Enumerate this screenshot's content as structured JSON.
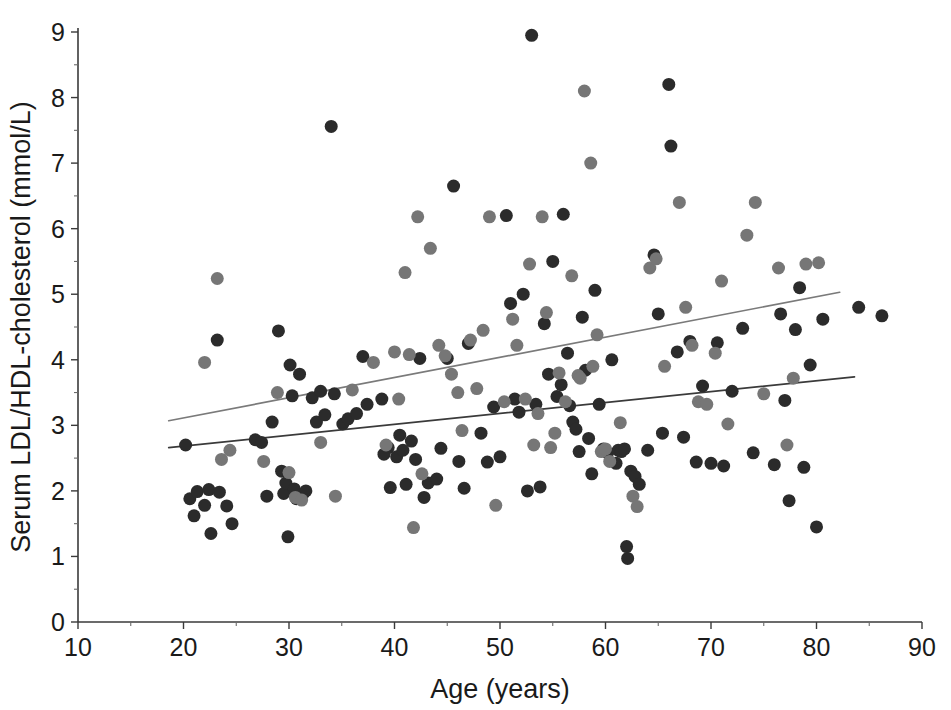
{
  "chart_data": {
    "type": "scatter",
    "title": "",
    "xlabel": "Age (years)",
    "ylabel": "Serum LDL/HDL-cholesterol  (mmol/L)",
    "xlim": [
      10,
      90
    ],
    "ylim": [
      0,
      9
    ],
    "xticks": [
      10,
      20,
      30,
      40,
      50,
      60,
      70,
      80,
      90
    ],
    "yticks": [
      0,
      1,
      2,
      3,
      4,
      5,
      6,
      7,
      8,
      9
    ],
    "x_minor_ticks": [
      15,
      25,
      35,
      45,
      55,
      65,
      75,
      85
    ],
    "y_minor_ticks": [
      0.5,
      1.5,
      2.5,
      3.5,
      4.5,
      5.5,
      6.5,
      7.5,
      8.5
    ],
    "grid": false,
    "legend": "none",
    "marker_radius_px": 6.5,
    "colors": {
      "series_dark": "#2b2b2b",
      "series_gray": "#767676",
      "trend_dark": "#3a3a3a",
      "trend_gray": "#7a7a7a",
      "axis": "#3a3a3a",
      "background": "#ffffff"
    },
    "series": [
      {
        "name": "Group A (dark markers)",
        "color": "#2b2b2b",
        "points": [
          [
            20.2,
            2.7
          ],
          [
            20.6,
            1.88
          ],
          [
            21.0,
            1.62
          ],
          [
            21.3,
            1.99
          ],
          [
            22.0,
            1.78
          ],
          [
            22.4,
            2.02
          ],
          [
            22.6,
            1.35
          ],
          [
            23.2,
            4.3
          ],
          [
            23.4,
            1.98
          ],
          [
            24.1,
            1.77
          ],
          [
            24.6,
            1.5
          ],
          [
            26.8,
            2.78
          ],
          [
            27.4,
            2.74
          ],
          [
            27.9,
            1.92
          ],
          [
            28.4,
            3.05
          ],
          [
            29.0,
            4.44
          ],
          [
            29.3,
            2.3
          ],
          [
            29.5,
            1.96
          ],
          [
            29.7,
            2.12
          ],
          [
            29.9,
            1.3
          ],
          [
            30.1,
            3.92
          ],
          [
            30.3,
            3.45
          ],
          [
            30.5,
            2.03
          ],
          [
            30.7,
            1.88
          ],
          [
            31.0,
            3.78
          ],
          [
            31.3,
            1.95
          ],
          [
            31.6,
            2.0
          ],
          [
            32.2,
            3.42
          ],
          [
            32.6,
            3.05
          ],
          [
            33.0,
            3.52
          ],
          [
            33.4,
            3.16
          ],
          [
            34.0,
            7.56
          ],
          [
            34.3,
            3.48
          ],
          [
            35.1,
            3.02
          ],
          [
            35.6,
            3.1
          ],
          [
            36.4,
            3.18
          ],
          [
            37.0,
            4.05
          ],
          [
            37.4,
            3.32
          ],
          [
            38.8,
            3.4
          ],
          [
            39.0,
            2.56
          ],
          [
            39.4,
            2.66
          ],
          [
            39.6,
            2.05
          ],
          [
            40.2,
            2.52
          ],
          [
            40.5,
            2.85
          ],
          [
            40.8,
            2.62
          ],
          [
            41.1,
            2.1
          ],
          [
            41.6,
            2.76
          ],
          [
            42.0,
            2.48
          ],
          [
            42.4,
            4.02
          ],
          [
            42.8,
            1.9
          ],
          [
            43.2,
            2.12
          ],
          [
            44.0,
            2.18
          ],
          [
            44.4,
            2.65
          ],
          [
            45.0,
            4.02
          ],
          [
            45.6,
            6.65
          ],
          [
            46.1,
            2.45
          ],
          [
            46.6,
            2.04
          ],
          [
            47.0,
            4.25
          ],
          [
            48.2,
            2.88
          ],
          [
            48.8,
            2.44
          ],
          [
            49.4,
            3.28
          ],
          [
            50.0,
            2.52
          ],
          [
            50.6,
            6.2
          ],
          [
            51.0,
            4.86
          ],
          [
            51.4,
            3.4
          ],
          [
            51.8,
            3.2
          ],
          [
            52.2,
            5.0
          ],
          [
            52.6,
            2.0
          ],
          [
            53.0,
            8.95
          ],
          [
            53.4,
            3.32
          ],
          [
            53.8,
            2.06
          ],
          [
            54.2,
            4.55
          ],
          [
            54.6,
            3.78
          ],
          [
            55.0,
            5.5
          ],
          [
            55.4,
            3.44
          ],
          [
            55.8,
            3.62
          ],
          [
            56.0,
            6.22
          ],
          [
            56.4,
            4.1
          ],
          [
            56.6,
            3.3
          ],
          [
            56.9,
            3.05
          ],
          [
            57.2,
            2.94
          ],
          [
            57.5,
            2.6
          ],
          [
            57.8,
            4.65
          ],
          [
            58.1,
            3.84
          ],
          [
            58.4,
            2.8
          ],
          [
            58.7,
            2.26
          ],
          [
            59.0,
            5.06
          ],
          [
            59.4,
            3.32
          ],
          [
            59.8,
            2.64
          ],
          [
            60.2,
            2.58
          ],
          [
            60.6,
            4.0
          ],
          [
            61.0,
            2.42
          ],
          [
            61.2,
            2.62
          ],
          [
            61.5,
            2.6
          ],
          [
            61.8,
            2.64
          ],
          [
            62.0,
            1.15
          ],
          [
            62.1,
            0.97
          ],
          [
            62.4,
            2.3
          ],
          [
            62.8,
            2.22
          ],
          [
            63.2,
            2.1
          ],
          [
            64.0,
            2.62
          ],
          [
            64.6,
            5.6
          ],
          [
            65.0,
            4.7
          ],
          [
            65.4,
            2.88
          ],
          [
            66.0,
            8.2
          ],
          [
            66.2,
            7.26
          ],
          [
            66.8,
            4.12
          ],
          [
            67.4,
            2.82
          ],
          [
            68.0,
            4.28
          ],
          [
            68.6,
            2.44
          ],
          [
            69.2,
            3.6
          ],
          [
            70.0,
            2.42
          ],
          [
            70.6,
            4.26
          ],
          [
            71.2,
            2.38
          ],
          [
            72.0,
            3.52
          ],
          [
            73.0,
            4.48
          ],
          [
            74.0,
            2.58
          ],
          [
            76.0,
            2.4
          ],
          [
            76.6,
            4.7
          ],
          [
            77.0,
            3.38
          ],
          [
            77.4,
            1.85
          ],
          [
            78.0,
            4.46
          ],
          [
            78.4,
            5.1
          ],
          [
            78.8,
            2.36
          ],
          [
            79.4,
            3.92
          ],
          [
            80.0,
            1.45
          ],
          [
            80.6,
            4.62
          ],
          [
            84.0,
            4.8
          ],
          [
            86.2,
            4.67
          ]
        ]
      },
      {
        "name": "Group B (gray markers)",
        "color": "#767676",
        "points": [
          [
            22.0,
            3.96
          ],
          [
            23.2,
            5.24
          ],
          [
            23.6,
            2.48
          ],
          [
            24.4,
            2.62
          ],
          [
            27.6,
            2.45
          ],
          [
            28.9,
            3.5
          ],
          [
            30.0,
            2.28
          ],
          [
            30.6,
            1.9
          ],
          [
            31.2,
            1.86
          ],
          [
            33.0,
            2.74
          ],
          [
            34.4,
            1.92
          ],
          [
            36.0,
            3.54
          ],
          [
            38.0,
            3.96
          ],
          [
            39.2,
            2.7
          ],
          [
            40.0,
            4.12
          ],
          [
            40.4,
            3.4
          ],
          [
            41.0,
            5.33
          ],
          [
            41.4,
            4.08
          ],
          [
            41.8,
            1.44
          ],
          [
            42.2,
            6.18
          ],
          [
            42.6,
            2.26
          ],
          [
            43.4,
            5.7
          ],
          [
            44.2,
            4.22
          ],
          [
            44.8,
            4.06
          ],
          [
            45.4,
            3.78
          ],
          [
            46.0,
            3.5
          ],
          [
            46.4,
            2.92
          ],
          [
            47.2,
            4.3
          ],
          [
            47.8,
            3.56
          ],
          [
            48.4,
            4.45
          ],
          [
            49.0,
            6.18
          ],
          [
            49.6,
            1.78
          ],
          [
            50.4,
            3.36
          ],
          [
            51.2,
            4.62
          ],
          [
            51.6,
            4.22
          ],
          [
            52.4,
            3.4
          ],
          [
            52.8,
            5.46
          ],
          [
            53.2,
            2.7
          ],
          [
            53.6,
            3.18
          ],
          [
            54.0,
            6.18
          ],
          [
            54.4,
            4.72
          ],
          [
            54.8,
            2.66
          ],
          [
            55.2,
            2.88
          ],
          [
            55.6,
            3.8
          ],
          [
            56.2,
            3.36
          ],
          [
            56.8,
            5.28
          ],
          [
            57.4,
            3.76
          ],
          [
            57.6,
            3.72
          ],
          [
            58.0,
            8.1
          ],
          [
            58.6,
            7.0
          ],
          [
            58.8,
            3.9
          ],
          [
            59.2,
            4.38
          ],
          [
            59.6,
            2.6
          ],
          [
            60.0,
            2.64
          ],
          [
            60.4,
            2.45
          ],
          [
            61.4,
            3.04
          ],
          [
            62.6,
            1.92
          ],
          [
            63.0,
            1.76
          ],
          [
            64.2,
            5.4
          ],
          [
            64.8,
            5.54
          ],
          [
            65.6,
            3.9
          ],
          [
            67.0,
            6.4
          ],
          [
            67.6,
            4.8
          ],
          [
            68.2,
            4.22
          ],
          [
            68.8,
            3.36
          ],
          [
            69.6,
            3.32
          ],
          [
            70.4,
            4.1
          ],
          [
            71.0,
            5.2
          ],
          [
            71.6,
            3.02
          ],
          [
            73.4,
            5.9
          ],
          [
            74.2,
            6.4
          ],
          [
            75.0,
            3.48
          ],
          [
            76.4,
            5.4
          ],
          [
            77.2,
            2.7
          ],
          [
            77.8,
            3.72
          ],
          [
            79.0,
            5.46
          ],
          [
            80.2,
            5.48
          ]
        ]
      }
    ],
    "trend_lines": [
      {
        "name": "Upper regression line (gray group)",
        "color": "#7a7a7a",
        "x_start": 18.6,
        "y_start": 3.07,
        "x_end": 82.2,
        "y_end": 5.03
      },
      {
        "name": "Lower regression line (dark group)",
        "color": "#3a3a3a",
        "x_start": 18.6,
        "y_start": 2.66,
        "x_end": 83.6,
        "y_end": 3.74
      }
    ]
  }
}
